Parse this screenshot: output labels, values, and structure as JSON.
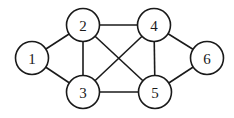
{
  "graph": {
    "radius": 16.5,
    "stroke_color": "#1a1a1a",
    "fill_color": "#ffffff",
    "nodes": [
      {
        "id": "1",
        "label": "1",
        "x": 32,
        "y": 58
      },
      {
        "id": "2",
        "label": "2",
        "x": 83,
        "y": 25
      },
      {
        "id": "3",
        "label": "3",
        "x": 83,
        "y": 92
      },
      {
        "id": "4",
        "label": "4",
        "x": 154,
        "y": 25
      },
      {
        "id": "5",
        "label": "5",
        "x": 155,
        "y": 92
      },
      {
        "id": "6",
        "label": "6",
        "x": 207,
        "y": 58
      }
    ],
    "edges": [
      {
        "from": "1",
        "to": "2"
      },
      {
        "from": "1",
        "to": "3"
      },
      {
        "from": "2",
        "to": "3"
      },
      {
        "from": "2",
        "to": "4"
      },
      {
        "from": "2",
        "to": "5"
      },
      {
        "from": "3",
        "to": "4"
      },
      {
        "from": "3",
        "to": "5"
      },
      {
        "from": "4",
        "to": "5"
      },
      {
        "from": "4",
        "to": "6"
      },
      {
        "from": "5",
        "to": "6"
      }
    ]
  }
}
